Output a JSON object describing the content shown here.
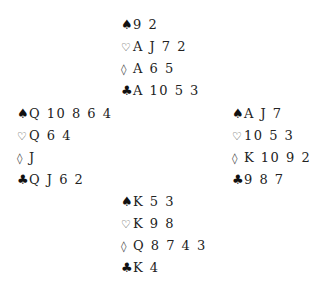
{
  "deal": {
    "north": {
      "spades": "9 2",
      "hearts": "A J 7 2",
      "diamonds": "A 6 5",
      "clubs": "A 10 5 3"
    },
    "west": {
      "spades": "Q 10 8 6 4",
      "hearts": "Q 6 4",
      "diamonds": "J",
      "clubs": "Q J 6 2"
    },
    "east": {
      "spades": "A J 7",
      "hearts": "10 5 3",
      "diamonds": "K 10 9 2",
      "clubs": "9 8 7"
    },
    "south": {
      "spades": "K 5 3",
      "hearts": "K 9 8",
      "diamonds": "Q 8 7 4 3",
      "clubs": "K 4"
    }
  },
  "symbols": {
    "spades": "♠",
    "hearts": "♡",
    "diamonds": "◊",
    "clubs": "♣"
  }
}
